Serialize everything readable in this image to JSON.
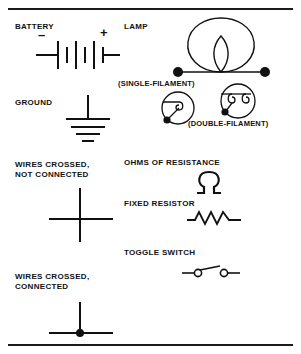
{
  "sheet": {
    "title": "Electrical Symbols Chart",
    "background_color": "#ffffff",
    "ink_color": "#111111",
    "width": 301,
    "height": 354
  },
  "rules": {
    "top_label": "top-divider-rule",
    "bottom_label": "bottom-divider-rule"
  },
  "left_column": {
    "battery": {
      "label": "BATTERY",
      "minus_sign": "–",
      "plus_sign": "+",
      "symbol_name": "battery-symbol",
      "cells": 3
    },
    "ground": {
      "label": "GROUND",
      "symbol_name": "ground-symbol",
      "bars": 4
    },
    "wires_crossed_not_connected": {
      "label_line1": "WIRES CROSSED,",
      "label_line2": "NOT CONNECTED",
      "symbol_name": "wires-crossed-not-connected-symbol"
    },
    "wires_crossed_connected": {
      "label_line1": "WIRES CROSSED,",
      "label_line2": "CONNECTED",
      "symbol_name": "wires-crossed-connected-symbol"
    }
  },
  "right_column": {
    "lamp": {
      "label": "LAMP",
      "symbol_name": "lamp-symbol",
      "caption_single": "(SINGLE-FILAMENT)",
      "caption_double": "(DOUBLE-FILAMENT)",
      "single_filament_symbol_name": "single-filament-lamp-symbol",
      "double_filament_symbol_name": "double-filament-lamp-symbol"
    },
    "ohms": {
      "label": "OHMS OF RESISTANCE",
      "symbol_name": "ohm-symbol",
      "glyph": "Ω"
    },
    "fixed_resistor": {
      "label": "FIXED RESISTOR",
      "symbol_name": "fixed-resistor-symbol"
    },
    "toggle_switch": {
      "label": "TOGGLE SWITCH",
      "symbol_name": "toggle-switch-symbol"
    }
  }
}
